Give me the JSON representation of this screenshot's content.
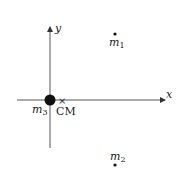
{
  "diagram": {
    "axes": {
      "x_label": "x",
      "y_label": "y"
    },
    "masses": [
      {
        "name": "m",
        "sub": "1"
      },
      {
        "name": "m",
        "sub": "2"
      },
      {
        "name": "m",
        "sub": "3"
      }
    ],
    "center_of_mass": {
      "label": "CM",
      "marker": "×"
    },
    "colors": {
      "ink": "#222222",
      "axis": "#555555"
    }
  }
}
